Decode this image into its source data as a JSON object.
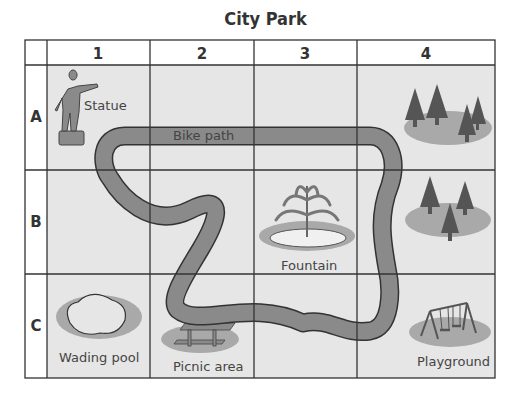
{
  "title": "City Park",
  "columns": [
    "1",
    "2",
    "3",
    "4"
  ],
  "rows": [
    "A",
    "B",
    "C"
  ],
  "landmarks": [
    {
      "name": "Statue",
      "cell": "A1",
      "icon": "statue-icon"
    },
    {
      "name": "Bike path",
      "cell": "A2",
      "icon": "bike-path"
    },
    {
      "name": "Trees",
      "cell": "A4",
      "icon": "trees-icon",
      "label": ""
    },
    {
      "name": "Trees",
      "cell": "B4",
      "icon": "trees-icon",
      "label": ""
    },
    {
      "name": "Fountain",
      "cell": "B3",
      "icon": "fountain-icon"
    },
    {
      "name": "Wading pool",
      "cell": "C1",
      "icon": "pool-icon"
    },
    {
      "name": "Picnic area",
      "cell": "C2",
      "icon": "picnic-table-icon"
    },
    {
      "name": "Playground",
      "cell": "C4",
      "icon": "swing-set-icon"
    }
  ],
  "labels": {
    "statue": "Statue",
    "bike_path": "Bike path",
    "fountain": "Fountain",
    "wading_pool": "Wading pool",
    "picnic_area": "Picnic area",
    "playground": "Playground"
  },
  "colors": {
    "cell_bg": "#e6e6e6",
    "grid": "#333333",
    "path": "#8a8a8a",
    "shadow": "#a9a9a9",
    "icon": "#7d7d7d"
  }
}
